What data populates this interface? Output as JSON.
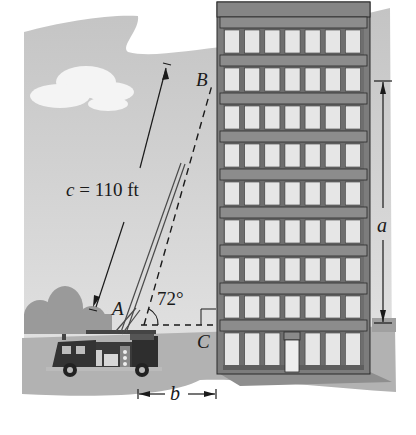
{
  "figure": {
    "type": "right-triangle word problem illustration",
    "scene": "Fire truck ladder reaching up to a multi-story building"
  },
  "labels": {
    "vertex_a": "A",
    "vertex_b": "B",
    "vertex_c": "C",
    "hypotenuse": "c = 110 ft",
    "side_a": "a",
    "side_b": "b",
    "angle_a": "72°"
  },
  "measurements": {
    "hypotenuse_length_ft": 110,
    "angle_at_A_deg": 72,
    "right_angle_at": "C"
  },
  "building": {
    "window_columns": 7,
    "floors": 9,
    "has_entrance_door": true
  },
  "colors": {
    "sky": "#c8c8c8",
    "ground": "#b4b4b4",
    "building_frame": "#7a7a7a",
    "band": "#8c8c8c",
    "window": "#e6e6e6",
    "ink": "#1a1a1a"
  }
}
